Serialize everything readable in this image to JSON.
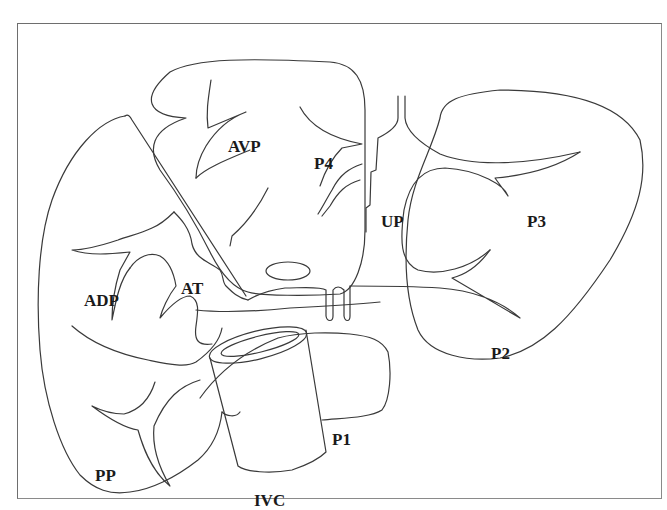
{
  "figure": {
    "type": "anatomical line diagram",
    "stroke_color": "#3a3a3a",
    "frame_color": "#6e6e6e",
    "background": "#ffffff"
  },
  "labels": {
    "avp": {
      "text": "AVP",
      "x": 228,
      "y": 146
    },
    "p4": {
      "text": "P4",
      "x": 314,
      "y": 161
    },
    "up": {
      "text": "UP",
      "x": 381,
      "y": 218
    },
    "p3": {
      "text": "P3",
      "x": 527,
      "y": 218
    },
    "adp": {
      "text": "ADP",
      "x": 84,
      "y": 298
    },
    "at": {
      "text": "AT",
      "x": 181,
      "y": 286
    },
    "p2": {
      "text": "P2",
      "x": 491,
      "y": 351
    },
    "p1": {
      "text": "P1",
      "x": 332,
      "y": 437
    },
    "pp": {
      "text": "PP",
      "x": 95,
      "y": 473
    },
    "ivc": {
      "text": "IVC",
      "x": 254,
      "y": 498
    }
  }
}
